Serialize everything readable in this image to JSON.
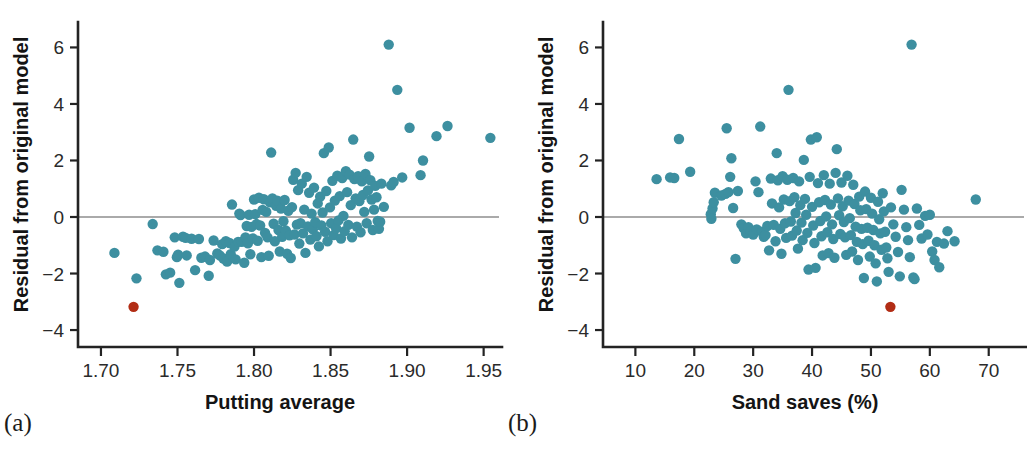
{
  "figure": {
    "background": "#ffffff",
    "point_color": "#3d8fa0",
    "highlight_color": "#b22d15",
    "axis_color": "#232323",
    "zero_line_color": "#8e8e8e",
    "point_radius": 5.2
  },
  "captions": {
    "panel_a": "(a)",
    "panel_b": "(b)"
  },
  "chart_data": [
    {
      "type": "scatter",
      "panel": "a",
      "title": "",
      "xlabel": "Putting average",
      "ylabel": "Residual from original model",
      "xlim": [
        1.685,
        1.962
      ],
      "ylim": [
        -4.6,
        6.9
      ],
      "xticks": [
        1.7,
        1.75,
        1.8,
        1.85,
        1.9,
        1.95
      ],
      "xticklabels": [
        "1.70",
        "1.75",
        "1.80",
        "1.85",
        "1.90",
        "1.95"
      ],
      "yticks": [
        6,
        4,
        2,
        0,
        -2,
        -4
      ],
      "yticklabels": [
        "6",
        "4",
        "2",
        "0",
        "−2",
        "−4"
      ],
      "grid": false,
      "legend": "none",
      "reference_line": {
        "y": 0,
        "color": "#8e8e8e"
      },
      "plot_box": {
        "x": 78,
        "y": 22,
        "width": 424,
        "height": 325
      },
      "highlight_point": {
        "x": 1.7213,
        "y": -3.18
      },
      "points": [
        [
          1.7088,
          -1.27
        ],
        [
          1.7232,
          -2.17
        ],
        [
          1.7338,
          -0.25
        ],
        [
          1.7369,
          -1.18
        ],
        [
          1.7408,
          -1.23
        ],
        [
          1.7424,
          -2.03
        ],
        [
          1.7452,
          -1.97
        ],
        [
          1.7482,
          -0.72
        ],
        [
          1.7496,
          -1.42
        ],
        [
          1.7504,
          -1.33
        ],
        [
          1.7512,
          -2.33
        ],
        [
          1.7536,
          -0.7
        ],
        [
          1.7553,
          -0.74
        ],
        [
          1.756,
          -1.36
        ],
        [
          1.7592,
          -0.77
        ],
        [
          1.7615,
          -1.88
        ],
        [
          1.764,
          -0.78
        ],
        [
          1.7656,
          -1.44
        ],
        [
          1.768,
          -1.4
        ],
        [
          1.7704,
          -2.08
        ],
        [
          1.7712,
          -1.52
        ],
        [
          1.7736,
          -0.83
        ],
        [
          1.776,
          -1.29
        ],
        [
          1.7776,
          -1.36
        ],
        [
          1.7792,
          -0.96
        ],
        [
          1.78,
          -1.47
        ],
        [
          1.7816,
          -0.86
        ],
        [
          1.7824,
          -1.58
        ],
        [
          1.784,
          -0.92
        ],
        [
          1.7848,
          -1.32
        ],
        [
          1.7856,
          0.44
        ],
        [
          1.7872,
          -1.05
        ],
        [
          1.788,
          -1.5
        ],
        [
          1.7896,
          -0.88
        ],
        [
          1.7904,
          0.12
        ],
        [
          1.7912,
          0.07
        ],
        [
          1.792,
          -0.88
        ],
        [
          1.7936,
          -1.62
        ],
        [
          1.7944,
          -0.72
        ],
        [
          1.7952,
          -0.32
        ],
        [
          1.796,
          -0.93
        ],
        [
          1.7968,
          0.08
        ],
        [
          1.7976,
          -1.32
        ],
        [
          1.7984,
          -0.35
        ],
        [
          1.7992,
          -0.76
        ],
        [
          1.8,
          0.62
        ],
        [
          1.8008,
          0.1
        ],
        [
          1.8016,
          -0.25
        ],
        [
          1.8024,
          -0.84
        ],
        [
          1.8032,
          0.68
        ],
        [
          1.804,
          -0.3
        ],
        [
          1.8048,
          -1.42
        ],
        [
          1.8056,
          0.25
        ],
        [
          1.8064,
          0.63
        ],
        [
          1.8072,
          -0.56
        ],
        [
          1.808,
          0.18
        ],
        [
          1.8088,
          -0.72
        ],
        [
          1.8096,
          -1.37
        ],
        [
          1.8104,
          0.52
        ],
        [
          1.8112,
          2.28
        ],
        [
          1.812,
          0.66
        ],
        [
          1.8128,
          -0.24
        ],
        [
          1.8136,
          -0.86
        ],
        [
          1.8144,
          0.4
        ],
        [
          1.8152,
          0.58
        ],
        [
          1.816,
          -0.46
        ],
        [
          1.8168,
          -1.22
        ],
        [
          1.8176,
          0.3
        ],
        [
          1.8184,
          -0.7
        ],
        [
          1.8192,
          -0.15
        ],
        [
          1.82,
          0.6
        ],
        [
          1.8208,
          -0.48
        ],
        [
          1.8216,
          -1.3
        ],
        [
          1.8224,
          0.22
        ],
        [
          1.8232,
          -0.65
        ],
        [
          1.824,
          -1.45
        ],
        [
          1.8248,
          0.35
        ],
        [
          1.8256,
          1.32
        ],
        [
          1.8264,
          -0.62
        ],
        [
          1.8272,
          1.56
        ],
        [
          1.828,
          -0.27
        ],
        [
          1.8288,
          0.95
        ],
        [
          1.8296,
          -0.94
        ],
        [
          1.8304,
          -0.22
        ],
        [
          1.8312,
          1.18
        ],
        [
          1.832,
          -0.58
        ],
        [
          1.8328,
          0.26
        ],
        [
          1.8336,
          -1.27
        ],
        [
          1.8344,
          1.42
        ],
        [
          1.8352,
          -0.33
        ],
        [
          1.836,
          0.86
        ],
        [
          1.8368,
          -0.8
        ],
        [
          1.8376,
          0.12
        ],
        [
          1.8384,
          -0.44
        ],
        [
          1.8392,
          1.04
        ],
        [
          1.84,
          -0.18
        ],
        [
          1.8408,
          -0.68
        ],
        [
          1.8416,
          0.48
        ],
        [
          1.8424,
          -1.04
        ],
        [
          1.8432,
          0.72
        ],
        [
          1.844,
          -0.3
        ],
        [
          1.8448,
          0.16
        ],
        [
          1.8456,
          2.26
        ],
        [
          1.8464,
          -0.52
        ],
        [
          1.8472,
          0.92
        ],
        [
          1.848,
          -0.86
        ],
        [
          1.8488,
          2.46
        ],
        [
          1.8496,
          0.34
        ],
        [
          1.8504,
          -0.22
        ],
        [
          1.8512,
          1.28
        ],
        [
          1.852,
          -0.64
        ],
        [
          1.8528,
          0.58
        ],
        [
          1.8536,
          -0.4
        ],
        [
          1.8544,
          1.46
        ],
        [
          1.8552,
          -0.12
        ],
        [
          1.856,
          0.74
        ],
        [
          1.8568,
          -0.76
        ],
        [
          1.8576,
          1.38
        ],
        [
          1.8584,
          0.04
        ],
        [
          1.8592,
          -0.5
        ],
        [
          1.86,
          1.62
        ],
        [
          1.8608,
          0.88
        ],
        [
          1.8616,
          -0.28
        ],
        [
          1.8624,
          1.5
        ],
        [
          1.8632,
          0.42
        ],
        [
          1.864,
          -0.72
        ],
        [
          1.8648,
          2.74
        ],
        [
          1.8656,
          1.34
        ],
        [
          1.8664,
          0.66
        ],
        [
          1.8672,
          -0.34
        ],
        [
          1.868,
          1.44
        ],
        [
          1.8688,
          0.56
        ],
        [
          1.8696,
          -0.54
        ],
        [
          1.8704,
          1.26
        ],
        [
          1.8712,
          0.78
        ],
        [
          1.872,
          0.18
        ],
        [
          1.8728,
          1.52
        ],
        [
          1.8736,
          -0.22
        ],
        [
          1.8744,
          0.94
        ],
        [
          1.8752,
          2.14
        ],
        [
          1.876,
          1.3
        ],
        [
          1.8768,
          0.62
        ],
        [
          1.8776,
          -0.46
        ],
        [
          1.8784,
          0.26
        ],
        [
          1.8792,
          1.1
        ],
        [
          1.88,
          0.7
        ],
        [
          1.8808,
          -0.14
        ],
        [
          1.8816,
          -0.42
        ],
        [
          1.8824,
          -0.17
        ],
        [
          1.8832,
          1.18
        ],
        [
          1.8848,
          0.36
        ],
        [
          1.888,
          6.1
        ],
        [
          1.8896,
          1.12
        ],
        [
          1.8912,
          1.24
        ],
        [
          1.8936,
          4.5
        ],
        [
          1.8968,
          1.4
        ],
        [
          1.9016,
          3.16
        ],
        [
          1.9088,
          1.48
        ],
        [
          1.9104,
          2.0
        ],
        [
          1.9192,
          2.86
        ],
        [
          1.9264,
          3.22
        ],
        [
          1.9544,
          2.8
        ]
      ]
    },
    {
      "type": "scatter",
      "panel": "b",
      "title": "",
      "xlabel": "Sand saves (%)",
      "ylabel": "Residual from original model",
      "xlim": [
        4.5,
        76.5
      ],
      "ylim": [
        -4.6,
        6.9
      ],
      "xticks": [
        10,
        20,
        30,
        40,
        50,
        60,
        70
      ],
      "xticklabels": [
        "10",
        "20",
        "30",
        "40",
        "50",
        "60",
        "70"
      ],
      "yticks": [
        6,
        4,
        2,
        0,
        -2,
        -4
      ],
      "yticklabels": [
        "6",
        "4",
        "2",
        "0",
        "−2",
        "−4"
      ],
      "grid": false,
      "legend": "none",
      "reference_line": {
        "y": 0,
        "color": "#8e8e8e"
      },
      "plot_box": {
        "x": 603,
        "y": 22,
        "width": 424,
        "height": 325
      },
      "highlight_point": {
        "x": 53.3,
        "y": -3.18
      },
      "points": [
        [
          13.6,
          1.34
        ],
        [
          15.9,
          1.4
        ],
        [
          16.6,
          1.38
        ],
        [
          17.4,
          2.76
        ],
        [
          19.3,
          1.6
        ],
        [
          22.8,
          0.1
        ],
        [
          22.9,
          -0.06
        ],
        [
          23.1,
          0.3
        ],
        [
          23.3,
          0.52
        ],
        [
          23.5,
          0.86
        ],
        [
          24.6,
          0.76
        ],
        [
          25.3,
          0.82
        ],
        [
          25.5,
          3.14
        ],
        [
          25.8,
          0.88
        ],
        [
          26.1,
          1.42
        ],
        [
          26.3,
          2.08
        ],
        [
          26.6,
          0.32
        ],
        [
          27.0,
          -1.48
        ],
        [
          27.4,
          0.92
        ],
        [
          28.0,
          -0.26
        ],
        [
          28.4,
          -0.4
        ],
        [
          28.8,
          -0.58
        ],
        [
          29.2,
          -0.36
        ],
        [
          29.6,
          -0.5
        ],
        [
          30.0,
          -0.62
        ],
        [
          30.4,
          1.26
        ],
        [
          30.6,
          -0.44
        ],
        [
          30.9,
          0.88
        ],
        [
          31.2,
          3.2
        ],
        [
          31.5,
          -0.52
        ],
        [
          31.8,
          -0.7
        ],
        [
          32.1,
          -0.64
        ],
        [
          32.4,
          -0.32
        ],
        [
          32.7,
          -1.18
        ],
        [
          33.0,
          1.36
        ],
        [
          33.2,
          0.48
        ],
        [
          33.5,
          -0.28
        ],
        [
          33.8,
          -0.86
        ],
        [
          34.0,
          2.26
        ],
        [
          34.2,
          1.3
        ],
        [
          34.4,
          0.34
        ],
        [
          34.6,
          -0.42
        ],
        [
          34.8,
          -1.3
        ],
        [
          35.0,
          1.44
        ],
        [
          35.2,
          0.62
        ],
        [
          35.4,
          -0.22
        ],
        [
          35.6,
          -0.74
        ],
        [
          35.8,
          1.32
        ],
        [
          36.0,
          4.5
        ],
        [
          36.2,
          0.56
        ],
        [
          36.4,
          -0.16
        ],
        [
          36.6,
          -0.66
        ],
        [
          36.8,
          1.38
        ],
        [
          37.0,
          0.7
        ],
        [
          37.2,
          0.14
        ],
        [
          37.4,
          -0.48
        ],
        [
          37.6,
          -1.12
        ],
        [
          37.8,
          1.26
        ],
        [
          38.0,
          0.42
        ],
        [
          38.2,
          -0.2
        ],
        [
          38.4,
          -0.82
        ],
        [
          38.6,
          2.02
        ],
        [
          38.8,
          0.64
        ],
        [
          39.0,
          0.08
        ],
        [
          39.2,
          -0.56
        ],
        [
          39.4,
          -1.86
        ],
        [
          39.6,
          1.42
        ],
        [
          39.8,
          2.74
        ],
        [
          40.0,
          0.36
        ],
        [
          40.2,
          -0.3
        ],
        [
          40.4,
          -0.92
        ],
        [
          40.6,
          -1.8
        ],
        [
          40.8,
          2.82
        ],
        [
          41.0,
          1.2
        ],
        [
          41.2,
          0.52
        ],
        [
          41.4,
          -0.14
        ],
        [
          41.6,
          -0.68
        ],
        [
          41.8,
          -1.36
        ],
        [
          42.0,
          1.48
        ],
        [
          42.2,
          0.6
        ],
        [
          42.4,
          0.02
        ],
        [
          42.6,
          -0.54
        ],
        [
          42.8,
          -1.28
        ],
        [
          43.0,
          1.18
        ],
        [
          43.2,
          0.44
        ],
        [
          43.4,
          -0.26
        ],
        [
          43.6,
          -0.78
        ],
        [
          43.8,
          -1.44
        ],
        [
          44.0,
          1.56
        ],
        [
          44.2,
          2.4
        ],
        [
          44.4,
          0.66
        ],
        [
          44.6,
          0.06
        ],
        [
          44.8,
          -0.6
        ],
        [
          45.0,
          1.22
        ],
        [
          45.2,
          0.38
        ],
        [
          45.4,
          -0.18
        ],
        [
          45.6,
          -0.72
        ],
        [
          45.8,
          -1.34
        ],
        [
          46.0,
          1.46
        ],
        [
          46.2,
          0.58
        ],
        [
          46.4,
          -0.04
        ],
        [
          46.6,
          -0.64
        ],
        [
          46.8,
          -1.22
        ],
        [
          47.0,
          1.14
        ],
        [
          47.2,
          0.46
        ],
        [
          47.4,
          -0.34
        ],
        [
          47.6,
          -0.88
        ],
        [
          47.8,
          -1.52
        ],
        [
          48.0,
          0.72
        ],
        [
          48.2,
          0.24
        ],
        [
          48.4,
          -0.42
        ],
        [
          48.6,
          -0.96
        ],
        [
          48.8,
          -2.16
        ],
        [
          49.0,
          0.9
        ],
        [
          49.2,
          0.28
        ],
        [
          49.4,
          -0.38
        ],
        [
          49.6,
          -0.84
        ],
        [
          49.8,
          -1.4
        ],
        [
          50.0,
          0.68
        ],
        [
          50.2,
          0.12
        ],
        [
          50.4,
          -0.46
        ],
        [
          50.6,
          -1.0
        ],
        [
          50.8,
          -1.64
        ],
        [
          51.0,
          -2.28
        ],
        [
          51.2,
          0.54
        ],
        [
          51.4,
          -0.08
        ],
        [
          51.6,
          -0.58
        ],
        [
          51.8,
          -1.16
        ],
        [
          52.0,
          0.84
        ],
        [
          52.2,
          0.2
        ],
        [
          52.4,
          -0.52
        ],
        [
          52.6,
          -1.08
        ],
        [
          52.8,
          -1.46
        ],
        [
          53.0,
          -1.94
        ],
        [
          53.4,
          0.34
        ],
        [
          53.8,
          -0.26
        ],
        [
          54.2,
          -0.7
        ],
        [
          54.6,
          -1.24
        ],
        [
          54.9,
          -2.1
        ],
        [
          55.2,
          0.96
        ],
        [
          55.6,
          0.26
        ],
        [
          56.0,
          -0.36
        ],
        [
          56.3,
          -0.82
        ],
        [
          56.6,
          -1.42
        ],
        [
          56.9,
          6.1
        ],
        [
          57.2,
          -2.14
        ],
        [
          57.4,
          -2.2
        ],
        [
          57.8,
          0.3
        ],
        [
          58.2,
          -0.28
        ],
        [
          58.6,
          -0.76
        ],
        [
          59.2,
          0.04
        ],
        [
          59.6,
          -0.62
        ],
        [
          60.0,
          0.08
        ],
        [
          60.4,
          -1.22
        ],
        [
          60.8,
          -1.52
        ],
        [
          61.2,
          -0.88
        ],
        [
          61.6,
          -1.78
        ],
        [
          62.4,
          -0.94
        ],
        [
          63.0,
          -0.5
        ],
        [
          64.2,
          -0.86
        ],
        [
          67.8,
          0.62
        ]
      ]
    }
  ]
}
